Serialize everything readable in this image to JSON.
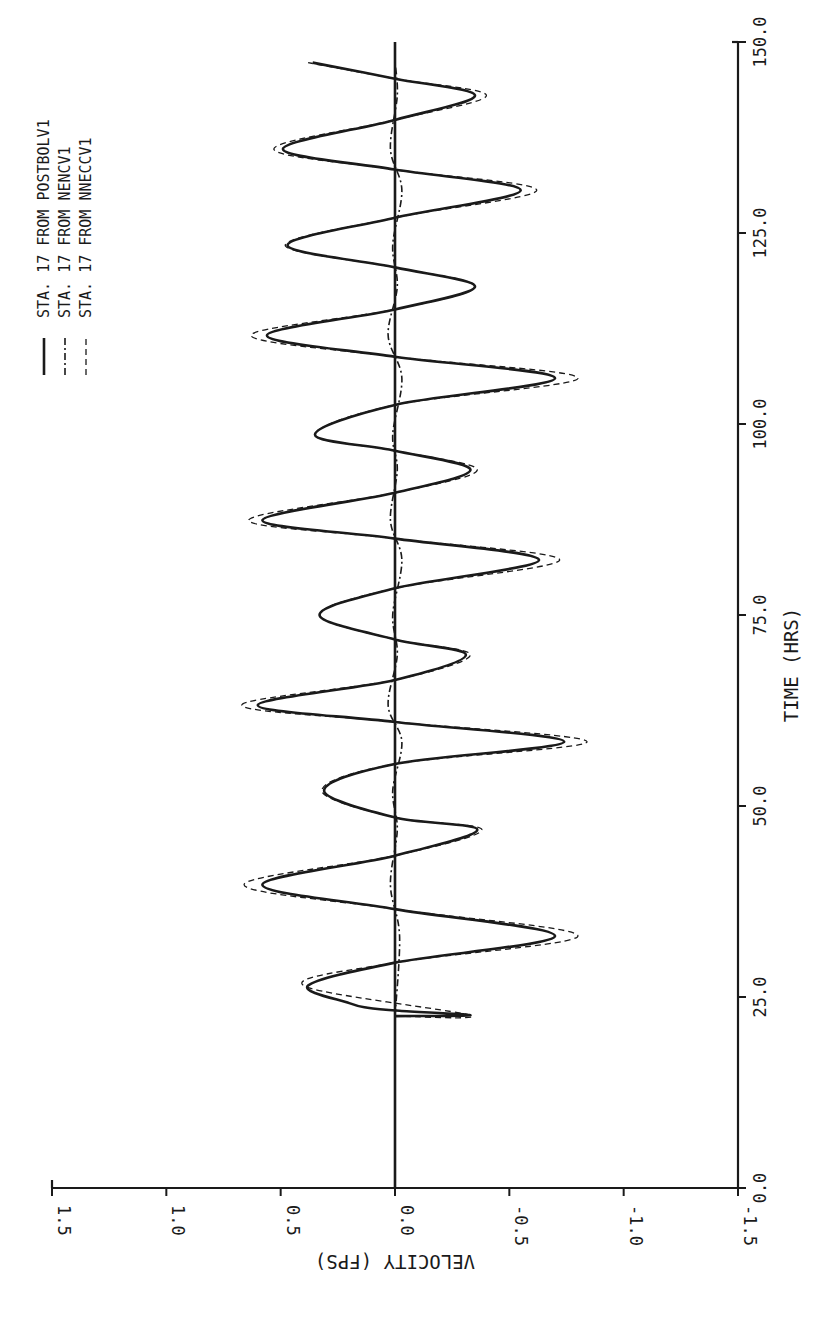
{
  "chart_data": {
    "type": "line",
    "orientation": "rotated-90-clockwise",
    "title": "",
    "xlabel": "TIME (HRS)",
    "ylabel": "VELOCITY (FPS)",
    "xlim": [
      0.0,
      150.0
    ],
    "ylim": [
      -1.5,
      1.5
    ],
    "x_ticks": [
      "0.0",
      "25.0",
      "50.0",
      "75.0",
      "100.0",
      "125.0",
      "150.0"
    ],
    "y_ticks": [
      "1.5",
      "1.0",
      "0.5",
      "0.0",
      "-0.5",
      "-1.0",
      "-1.5"
    ],
    "grid": false,
    "legend_position": "upper-left (rotated)",
    "legend": [
      {
        "label": "STA.  17 FROM POSTBOLV1",
        "style": "solid"
      },
      {
        "label": "STA.  17 FROM NENCV1",
        "style": "dash-dot"
      },
      {
        "label": "STA.  17 FROM NNECCV1",
        "style": "dashed"
      }
    ],
    "series": [
      {
        "name": "STA. 17 FROM POSTBOLV1",
        "style": "solid",
        "x": [
          22.5,
          22.6,
          23.2,
          23.6,
          24.2,
          26.5,
          29.5,
          33.0,
          36.5,
          39.7,
          43.5,
          46.9,
          48.5,
          52.0,
          55.5,
          58.4,
          61.0,
          63.2,
          66.5,
          69.8,
          71.8,
          75.0,
          78.5,
          82.2,
          85.0,
          87.4,
          91.0,
          94.0,
          96.5,
          98.6,
          102.5,
          106.0,
          108.8,
          111.6,
          115.0,
          118.0,
          120.5,
          123.4,
          127.0,
          130.6,
          133.3,
          136.0,
          139.8,
          143.0,
          145.2,
          147.3
        ],
        "y": [
          0.0,
          -0.33,
          -0.02,
          0.12,
          0.2,
          0.38,
          0.0,
          -0.7,
          0.0,
          0.58,
          0.0,
          -0.36,
          0.0,
          0.31,
          0.0,
          -0.74,
          0.0,
          0.6,
          0.0,
          -0.31,
          0.0,
          0.33,
          0.0,
          -0.63,
          0.0,
          0.58,
          0.0,
          -0.33,
          0.0,
          0.35,
          0.0,
          -0.7,
          0.0,
          0.56,
          0.0,
          -0.35,
          0.0,
          0.47,
          0.0,
          -0.55,
          0.0,
          0.49,
          0.0,
          -0.35,
          0.0,
          0.36
        ]
      },
      {
        "name": "STA. 17 FROM NENCV1",
        "style": "dash-dot",
        "x": [
          22.5,
          33.0,
          39.7,
          46.9,
          52.0,
          58.4,
          63.2,
          69.8,
          75.0,
          82.2,
          87.4,
          94.0,
          98.6,
          106.0,
          111.6,
          118.0,
          123.4,
          130.6,
          136.0,
          143.0,
          147.3
        ],
        "y": [
          0.0,
          -0.02,
          0.02,
          -0.01,
          0.01,
          -0.03,
          0.03,
          -0.01,
          0.01,
          -0.03,
          0.02,
          -0.01,
          0.01,
          -0.03,
          0.03,
          -0.01,
          0.01,
          -0.03,
          0.02,
          -0.01,
          0.0
        ]
      },
      {
        "name": "STA. 17 FROM NNECCV1",
        "style": "dashed",
        "x": [
          22.5,
          22.6,
          26.5,
          29.5,
          33.0,
          36.5,
          39.7,
          43.5,
          46.9,
          48.5,
          52.0,
          55.5,
          58.4,
          61.0,
          63.2,
          66.5,
          69.8,
          71.8,
          75.0,
          78.5,
          82.2,
          85.0,
          87.4,
          91.0,
          94.0,
          96.5,
          98.6,
          102.5,
          106.0,
          108.8,
          111.6,
          115.0,
          118.0,
          120.5,
          123.4,
          127.0,
          130.6,
          133.3,
          136.0,
          139.8,
          143.0,
          145.2,
          147.3
        ],
        "y": [
          0.0,
          -0.33,
          0.4,
          0.0,
          -0.8,
          0.0,
          0.66,
          0.0,
          -0.38,
          0.0,
          0.32,
          0.0,
          -0.84,
          0.0,
          0.67,
          0.0,
          -0.33,
          0.0,
          0.33,
          0.0,
          -0.72,
          0.0,
          0.64,
          0.0,
          -0.36,
          0.0,
          0.35,
          0.0,
          -0.8,
          0.0,
          0.63,
          0.0,
          -0.35,
          0.0,
          0.48,
          0.0,
          -0.62,
          0.0,
          0.53,
          0.0,
          -0.4,
          0.0,
          0.38
        ]
      }
    ]
  },
  "axes": {
    "time_label": "TIME (HRS)",
    "velocity_label": "VELOCITY (FPS)"
  }
}
